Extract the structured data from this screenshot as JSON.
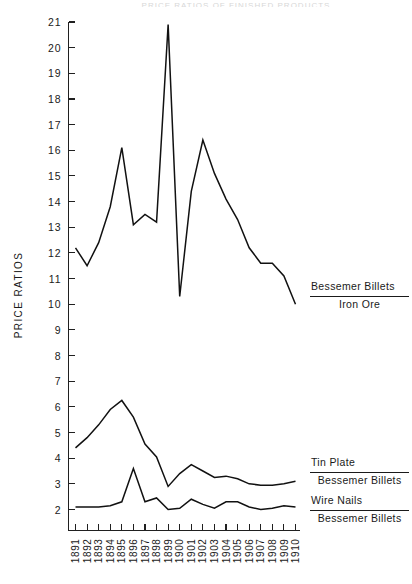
{
  "page": {
    "top_caption": "PRICE RATIOS OF FINISHED PRODUCTS"
  },
  "axes": {
    "ylabel": "PRICE RATIOS",
    "y_ticks": [
      21,
      20,
      19,
      18,
      17,
      16,
      15,
      14,
      13,
      12,
      11,
      10,
      9,
      8,
      7,
      6,
      5,
      4,
      3,
      2
    ],
    "x_ticks": [
      "1891",
      "1892",
      "1893",
      "1894",
      "1895",
      "1896",
      "1897",
      "1898",
      "1899",
      "1900",
      "1901",
      "1902",
      "1903",
      "1904",
      "1905",
      "1906",
      "1907",
      "1908",
      "1909",
      "1910"
    ]
  },
  "legend": [
    {
      "id": "bessemer-iron-ore",
      "numerator": "Bessemer Billets",
      "denominator": "Iron Ore"
    },
    {
      "id": "tin-plate-bessemer",
      "numerator": "Tin Plate",
      "denominator": "Bessemer Billets"
    },
    {
      "id": "wire-nails-bessemer",
      "numerator": "Wire Nails",
      "denominator": "Bessemer Billets"
    }
  ],
  "chart_data": {
    "type": "line",
    "title": "",
    "xlabel": "",
    "ylabel": "PRICE RATIOS",
    "x": [
      1891,
      1892,
      1893,
      1894,
      1895,
      1896,
      1897,
      1898,
      1899,
      1900,
      1901,
      1902,
      1903,
      1904,
      1905,
      1906,
      1907,
      1908,
      1909,
      1910
    ],
    "categories": [
      "1891",
      "1892",
      "1893",
      "1894",
      "1895",
      "1896",
      "1897",
      "1898",
      "1899",
      "1900",
      "1901",
      "1902",
      "1903",
      "1904",
      "1905",
      "1906",
      "1907",
      "1908",
      "1899",
      "1910"
    ],
    "xlim": [
      1891,
      1910
    ],
    "ylim": [
      2,
      21
    ],
    "grid": false,
    "legend_position": "right",
    "series": [
      {
        "name": "Bessemer Billets / Iron Ore",
        "values": [
          12.2,
          11.5,
          12.4,
          13.8,
          16.1,
          13.1,
          13.5,
          13.2,
          20.9,
          10.3,
          14.4,
          16.4,
          15.1,
          14.1,
          13.3,
          12.2,
          11.6,
          11.6,
          11.1,
          10.0
        ]
      },
      {
        "name": "Tin Plate / Bessemer Billets",
        "values": [
          4.4,
          4.8,
          5.3,
          5.9,
          6.25,
          5.6,
          4.55,
          4.05,
          2.9,
          3.4,
          3.75,
          3.5,
          3.25,
          3.3,
          3.2,
          3.0,
          2.95,
          2.95,
          3.0,
          3.1
        ]
      },
      {
        "name": "Wire Nails / Bessemer Billets",
        "values": [
          2.1,
          2.1,
          2.1,
          2.15,
          2.3,
          3.6,
          2.3,
          2.45,
          2.0,
          2.05,
          2.4,
          2.2,
          2.05,
          2.3,
          2.3,
          2.1,
          2.0,
          2.05,
          2.15,
          2.1
        ]
      }
    ]
  },
  "colors": {
    "line": "#111111",
    "axis": "#202020",
    "text": "#1a1a1a",
    "background": "#ffffff"
  }
}
